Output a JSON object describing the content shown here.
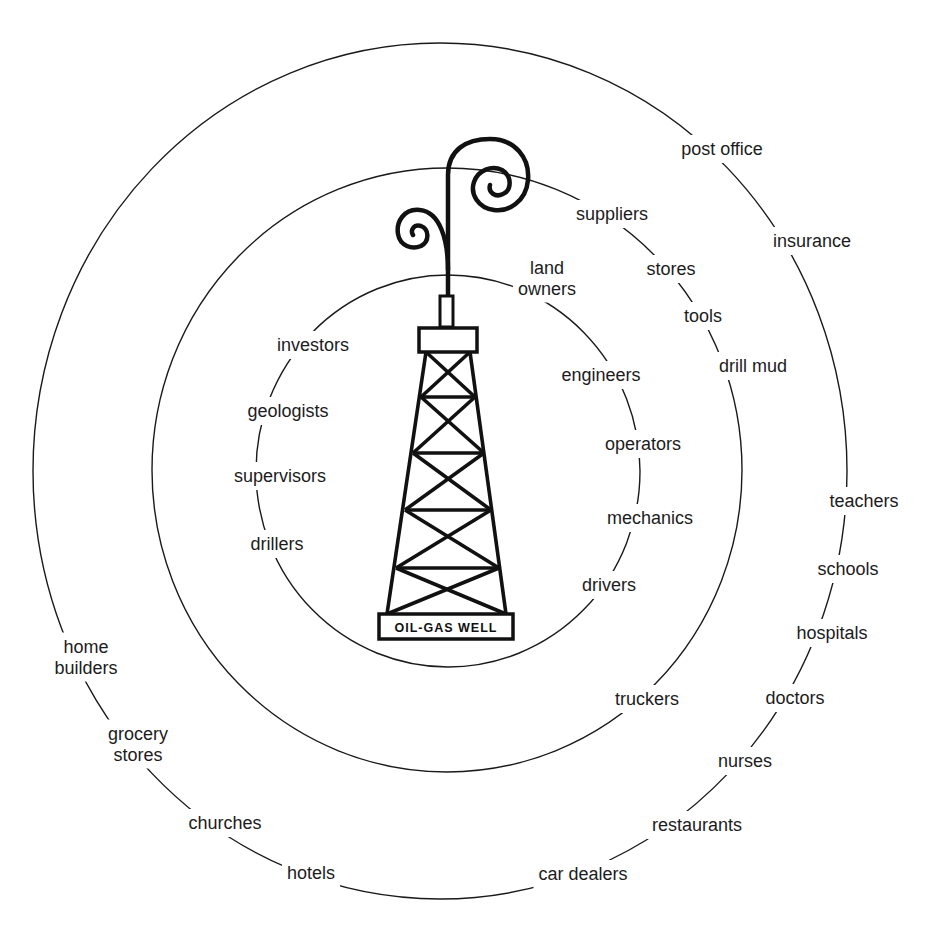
{
  "diagram": {
    "center_label": "OIL-GAS WELL",
    "icon": "oil-derrick-icon",
    "rings": [
      {
        "name": "inner",
        "labels": [
          {
            "id": "land-owners",
            "lines": [
              "land",
              "owners"
            ],
            "x": 547,
            "y": 284
          },
          {
            "id": "engineers",
            "lines": [
              "engineers"
            ],
            "x": 601,
            "y": 381
          },
          {
            "id": "operators",
            "lines": [
              "operators"
            ],
            "x": 643,
            "y": 450
          },
          {
            "id": "mechanics",
            "lines": [
              "mechanics"
            ],
            "x": 650,
            "y": 524
          },
          {
            "id": "drivers",
            "lines": [
              "drivers"
            ],
            "x": 609,
            "y": 591
          },
          {
            "id": "drillers",
            "lines": [
              "drillers"
            ],
            "x": 277,
            "y": 550
          },
          {
            "id": "supervisors",
            "lines": [
              "supervisors"
            ],
            "x": 280,
            "y": 482
          },
          {
            "id": "geologists",
            "lines": [
              "geologists"
            ],
            "x": 288,
            "y": 417
          },
          {
            "id": "investors",
            "lines": [
              "investors"
            ],
            "x": 313,
            "y": 351
          }
        ]
      },
      {
        "name": "middle",
        "labels": [
          {
            "id": "suppliers",
            "lines": [
              "suppliers"
            ],
            "x": 612,
            "y": 220
          },
          {
            "id": "stores",
            "lines": [
              "stores"
            ],
            "x": 671,
            "y": 275
          },
          {
            "id": "tools",
            "lines": [
              "tools"
            ],
            "x": 703,
            "y": 322
          },
          {
            "id": "drill-mud",
            "lines": [
              "drill mud"
            ],
            "x": 753,
            "y": 372
          },
          {
            "id": "truckers",
            "lines": [
              "truckers"
            ],
            "x": 647,
            "y": 705
          }
        ]
      },
      {
        "name": "outer",
        "labels": [
          {
            "id": "post-office",
            "lines": [
              "post office"
            ],
            "x": 722,
            "y": 155
          },
          {
            "id": "insurance",
            "lines": [
              "insurance"
            ],
            "x": 812,
            "y": 247
          },
          {
            "id": "teachers",
            "lines": [
              "teachers"
            ],
            "x": 864,
            "y": 507
          },
          {
            "id": "schools",
            "lines": [
              "schools"
            ],
            "x": 848,
            "y": 575
          },
          {
            "id": "hospitals",
            "lines": [
              "hospitals"
            ],
            "x": 832,
            "y": 639
          },
          {
            "id": "doctors",
            "lines": [
              "doctors"
            ],
            "x": 795,
            "y": 704
          },
          {
            "id": "nurses",
            "lines": [
              "nurses"
            ],
            "x": 745,
            "y": 767
          },
          {
            "id": "restaurants",
            "lines": [
              "restaurants"
            ],
            "x": 697,
            "y": 831
          },
          {
            "id": "car-dealers",
            "lines": [
              "car dealers"
            ],
            "x": 583,
            "y": 880
          },
          {
            "id": "hotels",
            "lines": [
              "hotels"
            ],
            "x": 311,
            "y": 879
          },
          {
            "id": "churches",
            "lines": [
              "churches"
            ],
            "x": 225,
            "y": 829
          },
          {
            "id": "grocery-stores",
            "lines": [
              "grocery",
              "stores"
            ],
            "x": 138,
            "y": 750
          },
          {
            "id": "home-builders",
            "lines": [
              "home",
              "builders"
            ],
            "x": 86,
            "y": 663
          }
        ]
      }
    ]
  }
}
